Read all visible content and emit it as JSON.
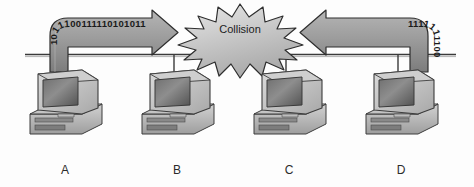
{
  "diagram": {
    "type": "network-topology",
    "background_color": "#fdfdfd"
  },
  "bus": {
    "label": "shared-ethernet-bus",
    "color": "#3a3a3a"
  },
  "collision": {
    "label": "Collision",
    "shape": "starburst",
    "fill_color": "#c9c9c9",
    "stroke_color": "#2e2e2e"
  },
  "frames": [
    {
      "id": "frame-a",
      "source": "A",
      "direction": "right",
      "bits_horizontal": "00111110101011",
      "bits_vertical": "10111",
      "fill_color": "#9a9a9a",
      "stroke_color": "#2e2e2e"
    },
    {
      "id": "frame-d",
      "source": "D",
      "direction": "left",
      "bits_horizontal": "1111111100",
      "bits_vertical": "10010",
      "fill_color": "#9a9a9a",
      "stroke_color": "#2e2e2e"
    }
  ],
  "nodes": [
    {
      "id": "node-a",
      "label": "A",
      "x": 24,
      "transmitting": true
    },
    {
      "id": "node-b",
      "label": "B",
      "x": 134,
      "transmitting": false
    },
    {
      "id": "node-c",
      "label": "C",
      "x": 244,
      "transmitting": false
    },
    {
      "id": "node-d",
      "label": "D",
      "x": 354,
      "transmitting": true
    }
  ]
}
